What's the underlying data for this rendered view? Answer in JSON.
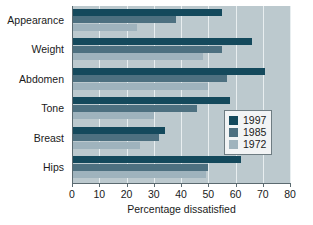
{
  "chart_data": {
    "type": "bar",
    "orientation": "horizontal",
    "title": "",
    "xlabel": "Percentage dissatisfied",
    "ylabel": "",
    "xlim": [
      0,
      80
    ],
    "xticks": [
      0,
      10,
      20,
      30,
      40,
      50,
      60,
      70,
      80
    ],
    "xtick_labels": [
      "0",
      "10",
      "20",
      "30",
      "40",
      "50",
      "60",
      "70",
      "80"
    ],
    "grid": true,
    "legend_position": "center-right",
    "categories": [
      "Appearance",
      "Weight",
      "Abdomen",
      "Tone",
      "Breast",
      "Hips"
    ],
    "series": [
      {
        "name": "1997",
        "color": "#14495c",
        "values": [
          55,
          66,
          71,
          58,
          34,
          62
        ]
      },
      {
        "name": "1985",
        "color": "#4d7080",
        "values": [
          38,
          55,
          57,
          46,
          32,
          50
        ]
      },
      {
        "name": "1972",
        "color": "#9fb3bd",
        "values": [
          24,
          48,
          50,
          30,
          25,
          49
        ]
      }
    ]
  },
  "colors": {
    "plot_background": "#bcc9ce",
    "page_background": "#ffffff",
    "gridline": "#e8eef0",
    "axis": "#5b6a70",
    "text": "#1a1a1a",
    "legend_background": "#f2f4f5",
    "legend_border": "#6e7c82"
  }
}
